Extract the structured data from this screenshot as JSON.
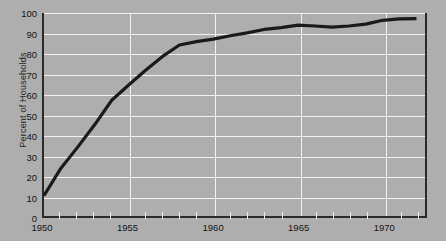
{
  "figure": {
    "background_color": "#aeaeae",
    "grid_color": "#f2f2f2",
    "axis_color": "#2a2a2a",
    "line_color": "#1a1a1a"
  },
  "axes": {
    "ylabel": "Percent of Households",
    "xlabel": "",
    "yticks": [
      0,
      10,
      20,
      30,
      40,
      50,
      60,
      70,
      80,
      90,
      100
    ],
    "xticks_labeled": [
      1950,
      1955,
      1960,
      1965,
      1970
    ],
    "xticks_minor": [
      1951,
      1952,
      1953,
      1954,
      1956,
      1957,
      1958,
      1959,
      1961,
      1962,
      1963,
      1964,
      1966,
      1967,
      1968,
      1969,
      1971,
      1972
    ]
  },
  "chart_data": {
    "type": "line",
    "title": "",
    "xlabel": "",
    "ylabel": "Percent of Households",
    "xlim": [
      1950,
      1972.5
    ],
    "ylim": [
      0,
      100
    ],
    "grid": true,
    "legend": "none",
    "x": [
      1950,
      1951,
      1952,
      1953,
      1954,
      1955,
      1956,
      1957,
      1958,
      1959,
      1960,
      1961,
      1962,
      1963,
      1964,
      1965,
      1966,
      1967,
      1968,
      1969,
      1970,
      1971,
      1972
    ],
    "values": [
      10,
      23.5,
      34,
      45,
      57,
      64.5,
      71.8,
      78.6,
      84.2,
      85.9,
      87.1,
      88.8,
      90.2,
      91.9,
      92.8,
      94.0,
      93.6,
      93.0,
      93.6,
      94.5,
      96.4,
      97.1,
      97.2
    ],
    "series": [
      {
        "name": "Percent of Households",
        "values": [
          10,
          23.5,
          34,
          45,
          57,
          64.5,
          71.8,
          78.6,
          84.2,
          85.9,
          87.1,
          88.8,
          90.2,
          91.9,
          92.8,
          94.0,
          93.6,
          93.0,
          93.6,
          94.5,
          96.4,
          97.1,
          97.2
        ]
      }
    ]
  }
}
